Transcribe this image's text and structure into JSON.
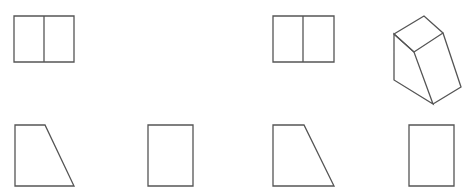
{
  "diagram": {
    "type": "orthographic-projection-views",
    "stroke_color": "#555555",
    "background": "#ffffff",
    "figures": [
      {
        "id": "view-top-left",
        "label": "",
        "shape": "rectangle-with-vertical-divider",
        "points": "14,16 74,16 74,62 14,62",
        "divider": "44,16 44,62"
      },
      {
        "id": "view-top-middle",
        "label": "",
        "shape": "rectangle-with-vertical-divider",
        "points": "273,16 334,16 334,62 273,62",
        "divider": "303,16 303,62"
      },
      {
        "id": "isometric-solid",
        "label": "",
        "shape": "isometric-wedge-block",
        "top_face": "394,34 424,16 443,33 414,52",
        "front_face": "394,34 394,80 433,104 414,52",
        "side_face": "443,33 461,87 433,104"
      },
      {
        "id": "view-bottom-1",
        "label": "",
        "shape": "trapezoid",
        "points": "15,125 45,125 74,186 15,186"
      },
      {
        "id": "view-bottom-2",
        "label": "",
        "shape": "rectangle",
        "points": "148,125 193,125 193,186 148,186"
      },
      {
        "id": "view-bottom-3",
        "label": "",
        "shape": "trapezoid",
        "points": "273,125 304,125 334,186 273,186"
      },
      {
        "id": "view-bottom-4",
        "label": "",
        "shape": "rectangle",
        "points": "409,125 454,125 454,186 409,186"
      }
    ]
  }
}
